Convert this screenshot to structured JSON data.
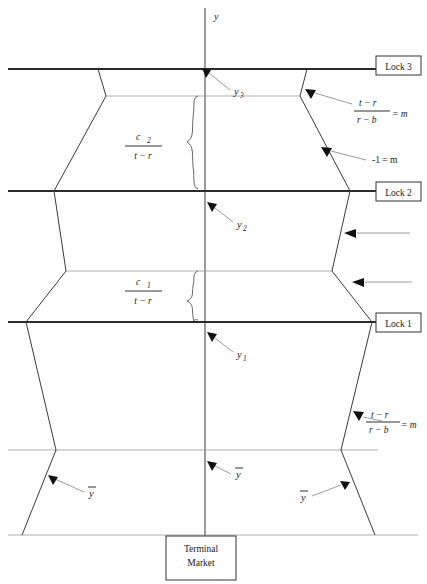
{
  "figure": {
    "axis_label": "y",
    "background": "#ffffff",
    "line_color": "#2b2b2b",
    "thin_line_color": "#9a9a9a",
    "leader_color": "#808080"
  },
  "boxes": [
    {
      "id": "lock3",
      "label": "Lock 3"
    },
    {
      "id": "lock2",
      "label": "Lock 2"
    },
    {
      "id": "lock1",
      "label": "Lock 1"
    },
    {
      "id": "terminal",
      "label_line1": "Terminal",
      "label_line2": "Market"
    }
  ],
  "axis_points": [
    {
      "id": "y3",
      "base": "y",
      "sub": "3"
    },
    {
      "id": "y2",
      "base": "y",
      "sub": "2"
    },
    {
      "id": "y1",
      "base": "y",
      "sub": "1"
    }
  ],
  "bar_labels": [
    {
      "id": "ybar-center",
      "base": "y",
      "overbar": true
    },
    {
      "id": "ybar-left",
      "base": "y",
      "overbar": true
    },
    {
      "id": "ybar-right",
      "base": "y",
      "overbar": true
    }
  ],
  "brace_labels": [
    {
      "id": "c2-brace",
      "numerator": "c",
      "numerator_sub": "2",
      "denominator": "t − r"
    },
    {
      "id": "c1-brace",
      "numerator": "c",
      "numerator_sub": "1",
      "denominator": "t − r"
    }
  ],
  "slope_labels": [
    {
      "id": "slope-upper-right",
      "numerator": "t − r",
      "denominator": "r − b",
      "equals": "= m"
    },
    {
      "id": "slope-minus-one",
      "text": "-1 = m"
    },
    {
      "id": "slope-lower-right",
      "numerator": "t − r",
      "denominator": "r − b",
      "equals": "= m"
    }
  ],
  "unlabeled_arrows": [
    {
      "id": "arrow-lock2-lower"
    },
    {
      "id": "arrow-lock1-upper"
    }
  ]
}
